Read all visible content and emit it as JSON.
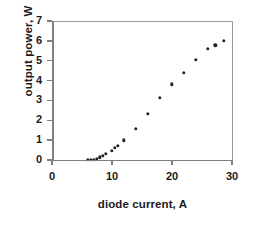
{
  "chart_data": {
    "type": "scatter",
    "title": "",
    "xlabel": "diode current, A",
    "ylabel": "output power, W",
    "xlim": [
      0,
      30
    ],
    "ylim": [
      0,
      7
    ],
    "xticks": [
      0,
      10,
      20,
      30
    ],
    "yticks": [
      0,
      1,
      2,
      3,
      4,
      5,
      6,
      7
    ],
    "xtick_labels": [
      "0",
      "10",
      "20",
      "30"
    ],
    "ytick_labels": [
      "0",
      "1",
      "2",
      "3",
      "4",
      "5",
      "6",
      "7"
    ],
    "grid": false,
    "legend": null,
    "marker_color": "#222222",
    "axis_color": "#808080",
    "series": [
      {
        "name": "output power",
        "x": [
          6.0,
          6.5,
          7.0,
          7.5,
          8.0,
          8.5,
          9.0,
          10.0,
          10.5,
          11.0,
          12.0,
          14.0,
          16.0,
          18.0,
          20.0,
          22.0,
          24.0,
          26.0,
          27.2,
          28.6
        ],
        "y": [
          0.0,
          0.0,
          0.02,
          0.07,
          0.14,
          0.22,
          0.3,
          0.46,
          0.62,
          0.72,
          1.0,
          1.56,
          2.34,
          3.13,
          3.82,
          4.4,
          5.05,
          5.6,
          5.78,
          6.0
        ]
      }
    ]
  },
  "axes": {
    "x_label": "diode current, A",
    "y_label": "output power, W"
  }
}
